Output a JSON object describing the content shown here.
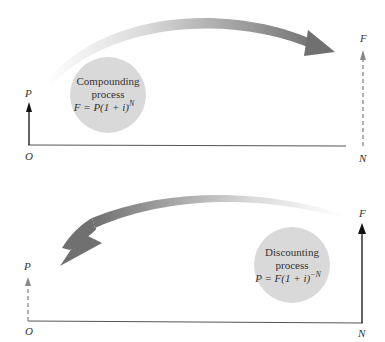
{
  "top_diagram": {
    "name": "compounding",
    "axis_labels": {
      "origin": "O",
      "end": "N"
    },
    "start_value_label": "P",
    "end_value_label": "F",
    "circle_text": {
      "line1": "Compounding",
      "line2": "process",
      "formula_main": "F = P(1 + i)",
      "formula_exp": "N"
    },
    "arrow_direction": "left-to-right"
  },
  "bottom_diagram": {
    "name": "discounting",
    "axis_labels": {
      "origin": "O",
      "end": "N"
    },
    "start_value_label": "P",
    "end_value_label": "F",
    "circle_text": {
      "line1": "Discounting",
      "line2": "process",
      "formula_main": "P = F(1 + i)",
      "formula_exp": "−N"
    },
    "arrow_direction": "right-to-left"
  },
  "colors": {
    "axis": "#555555",
    "arrow_dark": "#777777",
    "arrow_light": "#e6e6e6",
    "circle_fill": "#d9d9d9",
    "solid_arrow": "#111111",
    "dashed_arrow": "#888888"
  }
}
